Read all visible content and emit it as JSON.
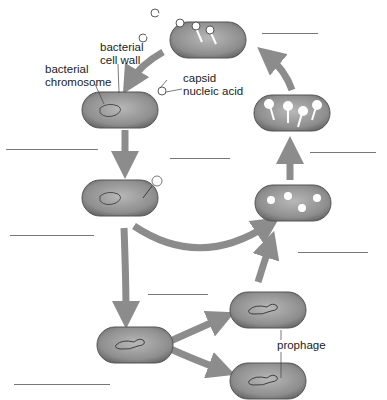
{
  "diagram": {
    "type": "bacteriophage life cycle (lytic and lysogenic)",
    "labels": {
      "cell_wall": "bacterial\ncell wall",
      "cell_wall_line1": "bacterial",
      "cell_wall_line2": "cell wall",
      "chromosome_line1": "bacterial",
      "chromosome_line2": "chromosome",
      "capsid": "capsid",
      "nucleic_acid": "nucleic acid",
      "prophage": "prophage"
    },
    "blank_lines": [
      {
        "x": 262,
        "y": 33,
        "w": 56
      },
      {
        "x": 6,
        "y": 149,
        "w": 92
      },
      {
        "x": 170,
        "y": 158,
        "w": 60
      },
      {
        "x": 310,
        "y": 152,
        "w": 66
      },
      {
        "x": 10,
        "y": 235,
        "w": 84
      },
      {
        "x": 298,
        "y": 252,
        "w": 70
      },
      {
        "x": 148,
        "y": 294,
        "w": 60
      },
      {
        "x": 14,
        "y": 384,
        "w": 96
      }
    ],
    "colors": {
      "cell_fill": "#8a8a8a",
      "cell_edge": "#555555",
      "arrow": "#8c8c8c",
      "text": "#222222"
    }
  }
}
